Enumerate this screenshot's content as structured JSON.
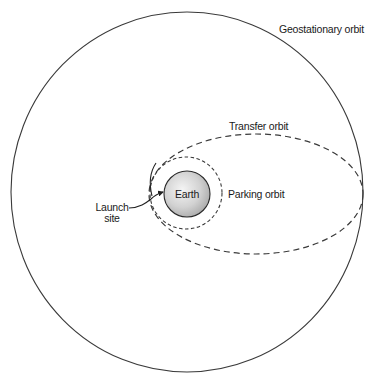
{
  "diagram": {
    "labels": {
      "geostationary": "Geostationary orbit",
      "transfer": "Transfer orbit",
      "parking": "Parking orbit",
      "earth": "Earth",
      "launch_line1": "Launch",
      "launch_line2": "site"
    },
    "colors": {
      "line": "#333333",
      "earth_light": "#f2f2f2",
      "earth_dark": "#b0b0b0",
      "background": "#ffffff"
    },
    "shapes": {
      "geostationary_orbit": {
        "cx": 187,
        "cy": 192,
        "rx": 176,
        "ry": 180,
        "style": "solid"
      },
      "transfer_orbit": {
        "cx": 256,
        "cy": 194,
        "rx": 107,
        "ry": 60,
        "style": "dashed"
      },
      "parking_orbit": {
        "cx": 186,
        "cy": 193,
        "r": 36,
        "style": "dashed"
      },
      "earth": {
        "cx": 187,
        "cy": 194,
        "r": 23
      }
    }
  }
}
